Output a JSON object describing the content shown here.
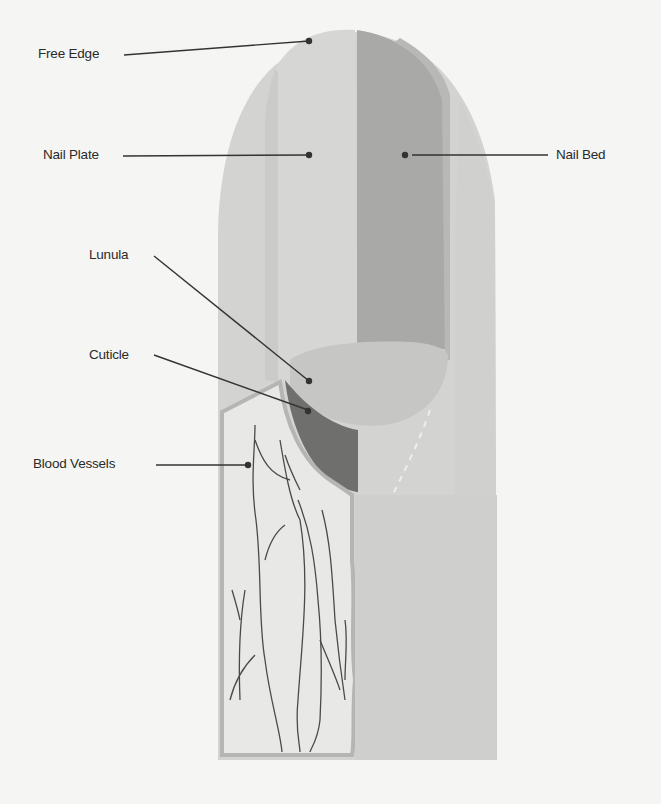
{
  "diagram": {
    "labels": [
      {
        "id": "free-edge",
        "text": "Free Edge",
        "x": 59,
        "y": 46
      },
      {
        "id": "nail-plate",
        "text": "Nail Plate",
        "x": 67,
        "y": 147
      },
      {
        "id": "nail-bed",
        "text": "Nail Bed",
        "x": 565,
        "y": 147
      },
      {
        "id": "lunula",
        "text": "Lunula",
        "x": 90,
        "y": 247
      },
      {
        "id": "cuticle",
        "text": "Cuticle",
        "x": 90,
        "y": 349
      },
      {
        "id": "blood-vessels",
        "text": "Blood Vessels",
        "x": 34,
        "y": 456
      }
    ],
    "colors": {
      "background": "#f5f5f3",
      "finger_skin": "#d3d3d1",
      "finger_skin_light": "#dadad8",
      "nail_plate": "#cbcbc9",
      "nail_plate_highlight": "#d6d6d4",
      "nail_bed": "#a9a9a7",
      "lunula": "#c4c4c2",
      "matrix_dark": "#6f6f6d",
      "vessel_panel": "#e8e8e6",
      "vessel_border": "#b5b5b3",
      "vessel_line": "#4a4a4a",
      "leader_line": "#333333"
    }
  }
}
